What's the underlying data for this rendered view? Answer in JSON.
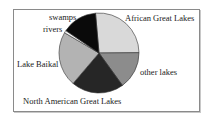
{
  "chart_data": {
    "type": "pie",
    "title": "",
    "categories": [
      "African Great Lakes",
      "other lakes",
      "North American Great Lakes",
      "Lake Baikal",
      "rivers",
      "swamps"
    ],
    "values": [
      26,
      15,
      21,
      22,
      1,
      14
    ],
    "unit": "percent (estimated from slice angles)",
    "colors": [
      "#d9d9d9",
      "#8c8c8c",
      "#262626",
      "#b3b3b3",
      "#f2f2f2",
      "#0a0a0a"
    ],
    "legend": "none (direct labels)"
  },
  "labels": {
    "african": "African Great Lakes",
    "other": "other lakes",
    "north_american": "North American Great Lakes",
    "baikal": "Lake Baikal",
    "rivers": "rivers",
    "swamps": "swamps"
  }
}
